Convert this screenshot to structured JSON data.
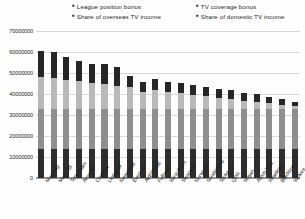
{
  "chart_data": {
    "type": "bar",
    "subtype": "stacked-column",
    "title": "",
    "xlabel": "",
    "ylabel": "",
    "ylim": [
      0,
      70000000
    ],
    "ytick_values": [
      0,
      10000000,
      20000000,
      30000000,
      40000000,
      50000000,
      60000000,
      70000000
    ],
    "ytick_labels": [
      "0",
      "10000000",
      "20000000",
      "30000000",
      "40000000",
      "50000000",
      "60000000",
      "70000000"
    ],
    "grid": true,
    "legend_position": "top",
    "categories": [
      "Man City",
      "Man Utd",
      "Tottenham",
      "Arsenal",
      "Chelsea",
      "Liverpool",
      "Newcastle",
      "Everton",
      "AVERAGE",
      "Fulham",
      "West Brom",
      "Swansea",
      "Norwich",
      "Sunderland",
      "Stoke",
      "QPR",
      "Wigan",
      "Aston Villa",
      "Reading",
      "Blackburn",
      "Wolves"
    ],
    "series": [
      {
        "name": "Share of domestic TV income",
        "color": "#2d2d2d",
        "values": [
          13800000,
          13800000,
          13800000,
          13800000,
          13800000,
          13800000,
          13800000,
          13800000,
          13800000,
          13800000,
          13800000,
          13800000,
          13800000,
          13800000,
          13800000,
          13800000,
          13800000,
          13800000,
          13800000,
          13800000,
          13800000
        ]
      },
      {
        "name": "Share of overseas TV income",
        "color": "#8e8e8e",
        "values": [
          18900000,
          18900000,
          18900000,
          18900000,
          18900000,
          18900000,
          18900000,
          18900000,
          18900000,
          18900000,
          18900000,
          18900000,
          18900000,
          18900000,
          18900000,
          18900000,
          18900000,
          18900000,
          18900000,
          18900000,
          18900000
        ]
      },
      {
        "name": "League position bonus",
        "color": "#b9b9b9",
        "values": [
          15400000,
          14700000,
          14000000,
          13300000,
          12600000,
          11900000,
          11200000,
          10500000,
          8100000,
          9100000,
          8400000,
          7700000,
          7000000,
          6300000,
          5600000,
          4900000,
          4200000,
          3500000,
          2800000,
          2100000,
          1400000
        ]
      },
      {
        "name": "TV coverage bonus",
        "color": "#262626",
        "values": [
          12300000,
          12500000,
          10800000,
          9800000,
          8900000,
          9500000,
          9200000,
          5500000,
          4900000,
          5500000,
          4800000,
          4800000,
          4500000,
          4200000,
          4000000,
          4500000,
          3600000,
          4000000,
          3200000,
          2900000,
          2300000
        ]
      }
    ],
    "totals": [
      60400000,
      59900000,
      57500000,
      55800000,
      54200000,
      54100000,
      53100000,
      48700000,
      45700000,
      47300000,
      45900000,
      45200000,
      44200000,
      43200000,
      42300000,
      42100000,
      40500000,
      40200000,
      38700000,
      37700000,
      36400000
    ]
  },
  "legend": {
    "marker": "▪",
    "left_column": [
      {
        "label": "League position bonus"
      },
      {
        "label": "Share of overseas TV income"
      }
    ],
    "right_column": [
      {
        "label": "TV coverage bonus"
      },
      {
        "label": "Share of domestic TV income"
      }
    ]
  }
}
